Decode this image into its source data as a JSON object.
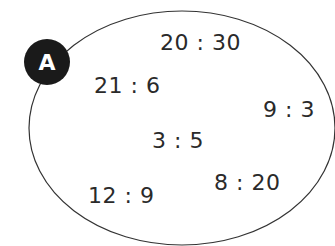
{
  "diagram": {
    "label": "A",
    "ratios": [
      {
        "text": "20 : 30",
        "x": 160,
        "y": 30
      },
      {
        "text": "21 : 6",
        "x": 94,
        "y": 73
      },
      {
        "text": "9 : 3",
        "x": 263,
        "y": 97
      },
      {
        "text": "3 : 5",
        "x": 152,
        "y": 128
      },
      {
        "text": "8 : 20",
        "x": 214,
        "y": 170
      },
      {
        "text": "12 : 9",
        "x": 88,
        "y": 183
      }
    ],
    "colors": {
      "ellipse_stroke": "#333333",
      "badge_fill": "#1a1a1a",
      "text": "#2a2a2a"
    }
  }
}
